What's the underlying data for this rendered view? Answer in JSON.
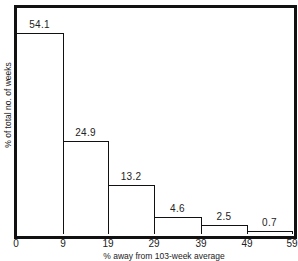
{
  "chart_data": {
    "type": "bar",
    "title": "",
    "xlabel": "% away from 103-week average",
    "ylabel": "% of total no. of weeks",
    "bin_edges": [
      0,
      9,
      19,
      29,
      39,
      49,
      59
    ],
    "tick_labels": [
      "0",
      "9",
      "19",
      "29",
      "39",
      "49",
      "59"
    ],
    "categories": [
      "0-9",
      "9-19",
      "19-29",
      "29-39",
      "39-49",
      "49-59"
    ],
    "values": [
      54.1,
      24.9,
      13.2,
      4.6,
      2.5,
      0.7
    ],
    "value_labels": [
      "54.1",
      "24.9",
      "13.2",
      "4.6",
      "2.5",
      "0.7"
    ],
    "xlim": [
      0,
      59
    ],
    "ylim": [
      0,
      60
    ],
    "grid": false,
    "legend": null,
    "histogram": true
  }
}
